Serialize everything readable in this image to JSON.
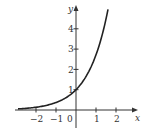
{
  "chart_data": {
    "type": "line",
    "title": "",
    "function": "y = e^x",
    "xlabel": "x",
    "ylabel": "y",
    "xlim": [
      -2.9,
      2.5
    ],
    "ylim": [
      -0.8,
      5.3
    ],
    "x_ticks": [
      -2,
      -1,
      0,
      1,
      2
    ],
    "x_tick_labels": [
      "−2",
      "−1",
      "0",
      "1",
      "2"
    ],
    "y_ticks": [
      1,
      2,
      3,
      4
    ],
    "y_tick_labels": [
      "1",
      "2",
      "3",
      "4"
    ],
    "grid": false,
    "legend": null,
    "series": [
      {
        "name": "e^x",
        "x": [
          -2.9,
          -2.5,
          -2,
          -1.5,
          -1,
          -0.5,
          0,
          0.5,
          1,
          1.25,
          1.5,
          1.6
        ],
        "values": [
          0.055,
          0.082,
          0.135,
          0.223,
          0.368,
          0.607,
          1,
          1.649,
          2.718,
          3.49,
          4.48,
          4.95
        ]
      }
    ]
  },
  "axes": {
    "x_label": "x",
    "y_label": "y",
    "ticks_x": [
      {
        "value": -2,
        "label": "−2"
      },
      {
        "value": -1,
        "label": "−1"
      },
      {
        "value": 1,
        "label": "1"
      },
      {
        "value": 2,
        "label": "2"
      }
    ],
    "origin_label": "0",
    "ticks_y": [
      {
        "value": 1,
        "label": "1"
      },
      {
        "value": 2,
        "label": "2"
      },
      {
        "value": 3,
        "label": "3"
      },
      {
        "value": 4,
        "label": "4"
      }
    ]
  },
  "style": {
    "axis_color": "#333333",
    "curve_color": "#222222"
  }
}
